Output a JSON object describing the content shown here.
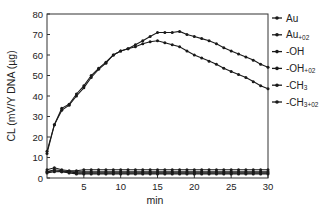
{
  "chart_data": {
    "type": "line",
    "title": "",
    "xlabel": "min",
    "ylabel": "CL (mV/Y DNA (µg)",
    "xlim": [
      0,
      30
    ],
    "ylim": [
      0,
      80
    ],
    "xticks": [
      5,
      10,
      15,
      20,
      25,
      30
    ],
    "yticks": [
      0,
      10,
      20,
      30,
      40,
      50,
      60,
      70,
      80
    ],
    "grid": false,
    "legend_position": "right",
    "x": [
      0,
      1,
      2,
      3,
      4,
      5,
      6,
      7,
      8,
      9,
      10,
      11,
      12,
      13,
      14,
      15,
      16,
      17,
      18,
      19,
      20,
      21,
      22,
      23,
      24,
      25,
      26,
      27,
      28,
      29,
      30
    ],
    "series": [
      {
        "name": "Au",
        "label_main": "Au",
        "label_sub": "",
        "values": [
          3,
          4,
          3.5,
          3,
          3,
          3,
          3,
          3,
          3,
          3,
          3,
          3,
          3,
          3,
          3,
          3,
          3,
          3,
          3,
          3,
          3,
          3,
          3,
          3,
          3,
          3,
          3,
          3,
          3,
          3,
          3
        ]
      },
      {
        "name": "Au+O2",
        "label_main": "Au",
        "label_sub": "+02",
        "values": [
          4,
          5,
          4,
          3.5,
          3.5,
          4,
          4,
          4,
          4,
          4,
          4,
          4,
          4,
          4,
          4,
          4,
          4,
          4,
          4,
          4,
          4,
          4,
          4,
          4,
          4,
          4,
          4,
          4,
          4,
          4,
          4
        ]
      },
      {
        "name": "-OH",
        "label_main": "-OH",
        "label_sub": "",
        "values": [
          12,
          26,
          33,
          35.5,
          40,
          44,
          49,
          53,
          56,
          60,
          62,
          63,
          64,
          65.5,
          66.5,
          67,
          66,
          65,
          64,
          62,
          60,
          58.5,
          57,
          55.5,
          53.5,
          52,
          50.5,
          49,
          47,
          45,
          43.5
        ]
      },
      {
        "name": "-OH+O2",
        "label_main": "-OH",
        "label_sub": "+02",
        "values": [
          13,
          26,
          34,
          36,
          41,
          45,
          50,
          53.5,
          56.5,
          60,
          62,
          63,
          65,
          67,
          69,
          71,
          71,
          71,
          71.5,
          70,
          69,
          68,
          67,
          65.5,
          63.5,
          62,
          60.5,
          59,
          57.5,
          55.5,
          54
        ]
      },
      {
        "name": "-CH3",
        "label_main": "-CH",
        "label_sub": "3",
        "values": [
          2.5,
          3,
          3,
          2.5,
          2,
          2,
          2,
          2,
          2,
          2,
          2,
          2,
          2,
          2,
          2,
          2,
          2,
          2,
          2,
          2,
          2,
          2,
          2,
          2,
          2,
          2,
          2,
          2,
          2,
          2,
          2
        ]
      },
      {
        "name": "-CH3+O2",
        "label_main": "-CH",
        "label_sub": "3+02",
        "values": [
          3,
          3.5,
          3,
          3,
          2.5,
          2.5,
          2.5,
          2.5,
          2.5,
          2.5,
          2.5,
          2.5,
          2.5,
          2.5,
          2.5,
          2.5,
          2.5,
          2.5,
          2.5,
          2.5,
          2.5,
          2.5,
          2.5,
          2.5,
          2.5,
          2.5,
          2.5,
          2.5,
          2.5,
          2.5,
          2.5
        ]
      }
    ]
  },
  "style": {
    "line_color": "#1a1a1a",
    "axis_color": "#333333",
    "background": "#ffffff"
  }
}
